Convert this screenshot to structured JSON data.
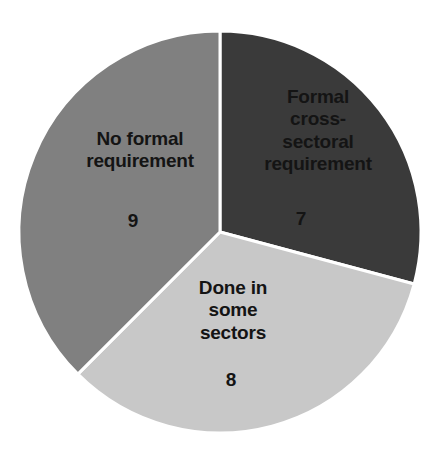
{
  "chart_data": {
    "type": "pie",
    "title": "",
    "subtitle": "",
    "xlabel": "",
    "ylabel": "",
    "legend": "none",
    "grid": false,
    "total": 24,
    "categories": [
      "Formal cross-sectoral requirement",
      "Done in some sectors",
      "No formal requirement"
    ],
    "values": [
      7,
      8,
      9
    ],
    "slices": [
      {
        "label": "Formal\ncross-\nsectoral\nrequirement",
        "label_plain": "Formal cross-sectoral requirement",
        "value": "7",
        "value_number": 7,
        "color": "#3a3a3a",
        "start_angle_deg": 0,
        "sweep_deg": 105
      },
      {
        "label": "Done in\nsome\nsectors",
        "label_plain": "Done in some sectors",
        "value": "8",
        "value_number": 8,
        "color": "#c8c8c8",
        "start_angle_deg": 105,
        "sweep_deg": 120
      },
      {
        "label": "No formal\nrequirement",
        "label_plain": "No formal requirement",
        "value": "9",
        "value_number": 9,
        "color": "#808080",
        "start_angle_deg": 225,
        "sweep_deg": 135
      }
    ],
    "geometry": {
      "center_x": 220,
      "center_y": 232,
      "radius": 201,
      "separator_color": "#ffffff",
      "separator_width": 3
    },
    "background_color": "#ffffff",
    "label_color": "#141414"
  }
}
